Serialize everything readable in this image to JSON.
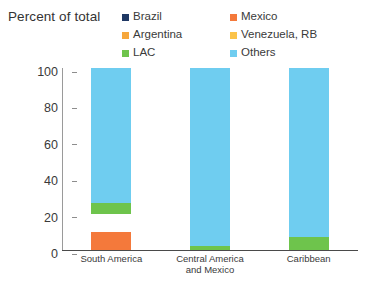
{
  "chart_data": {
    "type": "bar",
    "stacked": true,
    "title": "Percent of total",
    "xlabel": "",
    "ylabel": "",
    "ylim": [
      0,
      100
    ],
    "yticks": [
      0,
      20,
      40,
      60,
      80,
      100
    ],
    "grid": false,
    "legend_position": "top-right",
    "categories": [
      "South America",
      "Central America and Mexico",
      "Caribbean"
    ],
    "category_lines": [
      [
        "South America"
      ],
      [
        "Central America",
        "and Mexico"
      ],
      [
        "Caribbean"
      ]
    ],
    "series": [
      {
        "name": "Brazil",
        "color": "#1f3864",
        "values": [
          0,
          0,
          0
        ]
      },
      {
        "name": "Mexico",
        "color": "#f4793b",
        "values": [
          10,
          0,
          0
        ]
      },
      {
        "name": "Argentina",
        "color": "#f6a73c",
        "values": [
          0,
          0,
          0
        ]
      },
      {
        "name": "Venezuela, RB",
        "color": "#fbc githubusercontent",
        "values": [
          10,
          0,
          0
        ]
      },
      {
        "name": "LAC",
        "color": "#6ec44c",
        "values": [
          6,
          2,
          7
        ]
      },
      {
        "name": "Others",
        "color": "#6fcdf0",
        "values": [
          74,
          98,
          93
        ]
      }
    ]
  },
  "legend": {
    "items": [
      {
        "label": "Brazil",
        "color": "#1f3864",
        "icon": "legend-swatch-brazil"
      },
      {
        "label": "Mexico",
        "color": "#f4793b",
        "icon": "legend-swatch-mexico"
      },
      {
        "label": "Argentina",
        "color": "#f6a73c",
        "icon": "legend-swatch-argentina"
      },
      {
        "label": "Venezuela, RB",
        "color": "#fbc34a",
        "icon": "legend-swatch-venezuela"
      },
      {
        "label": "LAC",
        "color": "#6ec44c",
        "icon": "legend-swatch-lac"
      },
      {
        "label": "Others",
        "color": "#6fcdf0",
        "icon": "legend-swatch-others"
      }
    ]
  }
}
